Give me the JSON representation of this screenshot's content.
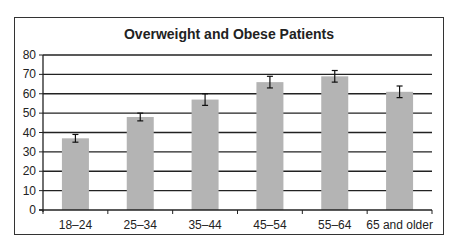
{
  "chart_data": {
    "type": "bar",
    "title": "Overweight and Obese Patients",
    "xlabel": "",
    "ylabel": "",
    "categories": [
      "18–24",
      "25–34",
      "35–44",
      "45–54",
      "55–64",
      "65 and older"
    ],
    "values": [
      37,
      48,
      57,
      66,
      69,
      61
    ],
    "error_bars": [
      2,
      2,
      3,
      3,
      3,
      3
    ],
    "ylim": [
      0,
      80
    ],
    "yticks": [
      0,
      10,
      20,
      30,
      40,
      50,
      60,
      70,
      80
    ],
    "grid": true,
    "legend": null,
    "bar_color": "#b4b4b4",
    "gridline_color": "#222222"
  }
}
